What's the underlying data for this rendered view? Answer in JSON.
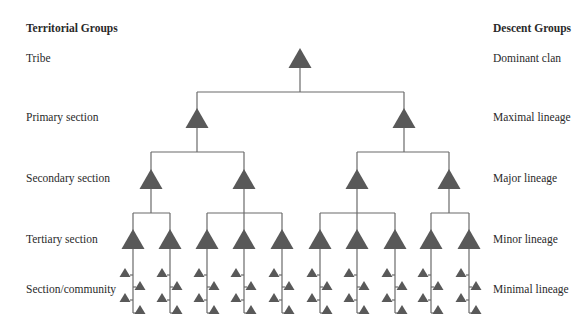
{
  "headings": {
    "left": "Territorial Groups",
    "right": "Descent Groups"
  },
  "levels": [
    {
      "territorial": "Tribe",
      "descent": "Dominant clan",
      "y": 58
    },
    {
      "territorial": "Primary section",
      "descent": "Maximal lineage",
      "y": 117
    },
    {
      "territorial": "Secondary section",
      "descent": "Major lineage",
      "y": 178
    },
    {
      "territorial": "Tertiary section",
      "descent": "Minor lineage",
      "y": 239
    },
    {
      "territorial": "Section/community",
      "descent": "Minimal lineage",
      "y": 289
    }
  ],
  "colors": {
    "triangle": "#595959",
    "line": "#6a6a6a",
    "text": "#2a2a2a"
  },
  "tree": {
    "level0": [
      300
    ],
    "level1": [
      197,
      404
    ],
    "level2": [
      151,
      244,
      357,
      449
    ],
    "level3": [
      133,
      170,
      207,
      244,
      282,
      320,
      357,
      395,
      431,
      469
    ],
    "groups2": [
      [
        151,
        244
      ],
      [
        357,
        449
      ]
    ],
    "groups3": [
      [
        133,
        170
      ],
      [
        207,
        244,
        282
      ],
      [
        320,
        357,
        395
      ],
      [
        431,
        469
      ]
    ]
  }
}
